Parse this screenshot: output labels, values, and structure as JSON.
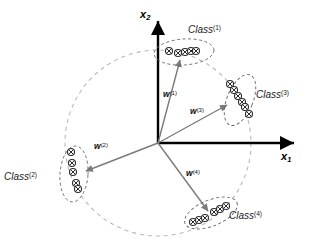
{
  "figure": {
    "background_color": "#ffffff",
    "axis_color": "#000000",
    "vector_color": "#808080",
    "circle_color": "#b3b3b3",
    "ellipse_color": "#555555",
    "marker_color": "#2b2b2b"
  },
  "axes": {
    "x_axis": {
      "label": "x",
      "subscript": "1",
      "origin": [
        158,
        143
      ],
      "end": [
        298,
        143
      ]
    },
    "y_axis": {
      "label": "x",
      "subscript": "2",
      "origin": [
        158,
        143
      ],
      "end": [
        158,
        16
      ]
    }
  },
  "decision_circle": {
    "center": [
      158,
      143
    ],
    "radius": 93,
    "style": "dashed"
  },
  "classes": [
    {
      "id": "class-1",
      "label": "Class",
      "superscript": "(1)",
      "label_pos": [
        188,
        33
      ],
      "ellipse": {
        "cx": 184,
        "cy": 52,
        "rx": 30,
        "ry": 13,
        "rotation": -4
      },
      "points": [
        [
          169,
          51
        ],
        [
          178,
          53
        ],
        [
          185,
          52
        ],
        [
          191,
          51
        ],
        [
          196,
          51
        ]
      ]
    },
    {
      "id": "class-2",
      "label": "Class",
      "superscript": "(2)",
      "label_pos": [
        6,
        177
      ],
      "ellipse": {
        "cx": 74,
        "cy": 174,
        "rx": 14,
        "ry": 28,
        "rotation": 4
      },
      "points": [
        [
          71,
          152
        ],
        [
          72,
          163
        ],
        [
          73,
          172
        ],
        [
          76,
          183
        ],
        [
          78,
          188
        ]
      ]
    },
    {
      "id": "class-3",
      "label": "Class",
      "superscript": "(3)",
      "label_pos": [
        258,
        95
      ],
      "ellipse": {
        "cx": 240,
        "cy": 100,
        "rx": 13,
        "ry": 27,
        "rotation": 22
      },
      "points": [
        [
          230,
          84
        ],
        [
          234,
          90
        ],
        [
          238,
          96
        ],
        [
          242,
          102
        ],
        [
          245,
          107
        ],
        [
          249,
          113
        ]
      ]
    },
    {
      "id": "class-4",
      "label": "Class",
      "superscript": "(4)",
      "label_pos": [
        232,
        216
      ],
      "ellipse": {
        "cx": 211,
        "cy": 213,
        "rx": 28,
        "ry": 13,
        "rotation": -22
      },
      "points": [
        [
          193,
          222
        ],
        [
          199,
          220
        ],
        [
          205,
          217
        ],
        [
          214,
          212
        ],
        [
          220,
          209
        ],
        [
          225,
          206
        ]
      ]
    }
  ],
  "weight_vectors": [
    {
      "id": "w-1",
      "label": "w",
      "superscript": "(1)",
      "label_pos": [
        163,
        95
      ],
      "from": [
        158,
        143
      ],
      "to": [
        180,
        58
      ]
    },
    {
      "id": "w-2",
      "label": "w",
      "superscript": "(2)",
      "label_pos": [
        94,
        147
      ],
      "from": [
        158,
        143
      ],
      "to": [
        83,
        172
      ]
    },
    {
      "id": "w-3",
      "label": "w",
      "superscript": "(3)",
      "label_pos": [
        190,
        110
      ],
      "from": [
        158,
        143
      ],
      "to": [
        228,
        104
      ]
    },
    {
      "id": "w-4",
      "label": "w",
      "superscript": "(4)",
      "label_pos": [
        186,
        173
      ],
      "from": [
        158,
        143
      ],
      "to": [
        210,
        214
      ]
    }
  ]
}
